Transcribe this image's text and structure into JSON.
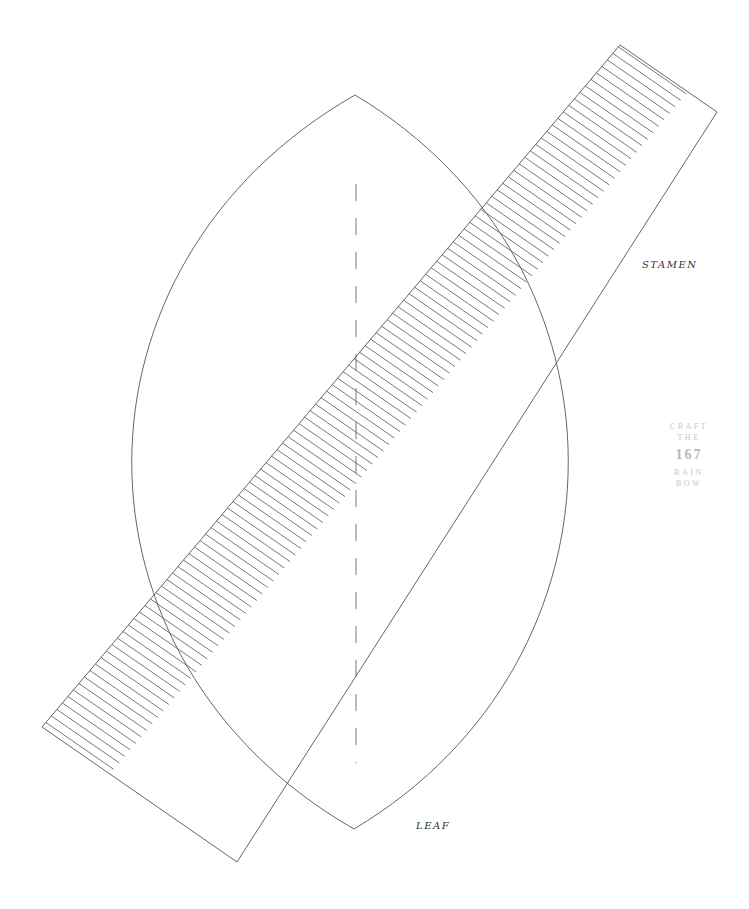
{
  "labels": {
    "stamen": "STAMEN",
    "leaf": "LEAF"
  },
  "stamp": {
    "line1": "CRAFT",
    "line2": "THE",
    "number": "167",
    "line3": "RAIN",
    "line4": "BOW"
  },
  "colors": {
    "stroke": "#555555",
    "hatch": "#555555",
    "stamp_text": "#c6c6c6",
    "label_text": "#333333",
    "background": "#ffffff"
  },
  "geometry": {
    "strip": {
      "top": [
        620,
        45
      ],
      "right": [
        717,
        112
      ],
      "bottom": [
        237,
        862
      ],
      "left": [
        42,
        727
      ],
      "hatch_count": 105,
      "hatch_length_ratio": 0.7
    },
    "leaf": {
      "top": [
        355,
        95
      ],
      "bottom": [
        354,
        829
      ],
      "left_extreme": [
        186,
        462
      ],
      "right_extreme": [
        517,
        462
      ]
    },
    "dashed_axis": {
      "x": 356,
      "y_start": 184,
      "y_end": 763,
      "dash": 17,
      "gap": 17
    }
  }
}
